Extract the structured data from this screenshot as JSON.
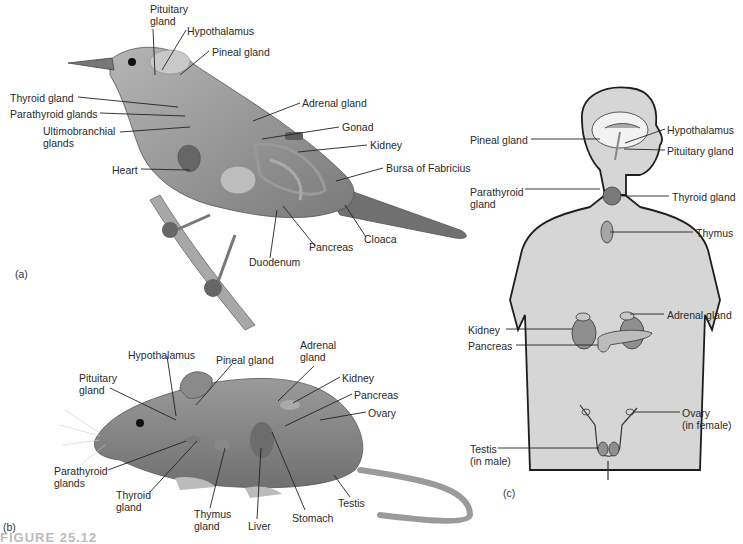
{
  "figure": {
    "caption_partial": "FIGURE 25.12",
    "panels": {
      "a": "(a)",
      "b": "(b)",
      "c": "(c)"
    }
  },
  "bird": {
    "subject": "bird",
    "labels": [
      {
        "id": "pituitary",
        "text": "Pituitary\ngland",
        "x": 150,
        "y": 3
      },
      {
        "id": "hypothalamus",
        "text": "Hypothalamus",
        "x": 187,
        "y": 25
      },
      {
        "id": "pineal",
        "text": "Pineal gland",
        "x": 212,
        "y": 46
      },
      {
        "id": "thyroid",
        "text": "Thyroid gland",
        "x": 10,
        "y": 92
      },
      {
        "id": "parathyroid",
        "text": "Parathyroid glands",
        "x": 10,
        "y": 108
      },
      {
        "id": "ultimobranchial",
        "text": "Ultimobranchial\nglands",
        "x": 43,
        "y": 125
      },
      {
        "id": "heart",
        "text": "Heart",
        "x": 112,
        "y": 164
      },
      {
        "id": "adrenal",
        "text": "Adrenal gland",
        "x": 302,
        "y": 97
      },
      {
        "id": "gonad",
        "text": "Gonad",
        "x": 342,
        "y": 121
      },
      {
        "id": "kidney",
        "text": "Kidney",
        "x": 370,
        "y": 139
      },
      {
        "id": "bursa",
        "text": "Bursa of Fabricius",
        "x": 386,
        "y": 162
      },
      {
        "id": "cloaca",
        "text": "Cloaca",
        "x": 364,
        "y": 233
      },
      {
        "id": "pancreas",
        "text": "Pancreas",
        "x": 309,
        "y": 241
      },
      {
        "id": "duodenum",
        "text": "Duodenum",
        "x": 249,
        "y": 256
      }
    ]
  },
  "mouse": {
    "subject": "mouse",
    "labels": [
      {
        "id": "hypothalamus",
        "text": "Hypothalamus",
        "x": 128,
        "y": 349
      },
      {
        "id": "pineal",
        "text": "Pineal gland",
        "x": 216,
        "y": 354
      },
      {
        "id": "adrenal",
        "text": "Adrenal\ngland",
        "x": 300,
        "y": 339
      },
      {
        "id": "pituitary",
        "text": "Pituitary\ngland",
        "x": 79,
        "y": 372
      },
      {
        "id": "kidney",
        "text": "Kidney",
        "x": 342,
        "y": 372
      },
      {
        "id": "pancreas",
        "text": "Pancreas",
        "x": 354,
        "y": 389
      },
      {
        "id": "ovary",
        "text": "Ovary",
        "x": 368,
        "y": 407
      },
      {
        "id": "parathyroid",
        "text": "Parathyroid\nglands",
        "x": 54,
        "y": 465
      },
      {
        "id": "thyroid",
        "text": "Thyroid\ngland",
        "x": 116,
        "y": 489
      },
      {
        "id": "thymus",
        "text": "Thymus\ngland",
        "x": 194,
        "y": 508
      },
      {
        "id": "liver",
        "text": "Liver",
        "x": 248,
        "y": 520
      },
      {
        "id": "stomach",
        "text": "Stomach",
        "x": 292,
        "y": 512
      },
      {
        "id": "testis",
        "text": "Testis",
        "x": 338,
        "y": 497
      }
    ]
  },
  "human": {
    "subject": "human",
    "labels": [
      {
        "id": "pineal",
        "text": "Pineal gland",
        "x": 470,
        "y": 134
      },
      {
        "id": "hypothalamus",
        "text": "Hypothalamus",
        "x": 667,
        "y": 124
      },
      {
        "id": "pituitary",
        "text": "Pituitary gland",
        "x": 667,
        "y": 145
      },
      {
        "id": "parathyroid",
        "text": "Parathyroid\ngland",
        "x": 470,
        "y": 186
      },
      {
        "id": "thyroid",
        "text": "Thyroid gland",
        "x": 672,
        "y": 191
      },
      {
        "id": "thymus",
        "text": "Thymus",
        "x": 696,
        "y": 227
      },
      {
        "id": "adrenal",
        "text": "Adrenal gland",
        "x": 667,
        "y": 309
      },
      {
        "id": "kidney",
        "text": "Kidney",
        "x": 468,
        "y": 324
      },
      {
        "id": "pancreas",
        "text": "Pancreas",
        "x": 468,
        "y": 340
      },
      {
        "id": "ovary",
        "text": "Ovary\n(in female)",
        "x": 682,
        "y": 407
      },
      {
        "id": "testis",
        "text": "Testis\n(in male)",
        "x": 470,
        "y": 443
      }
    ]
  },
  "colors": {
    "body_fill": "#d6d6d6",
    "organ_fill": "#9a9a9a",
    "outline": "#1e1e1e",
    "animal_fill": "#8e8e8e",
    "leader_line": "#222222"
  }
}
